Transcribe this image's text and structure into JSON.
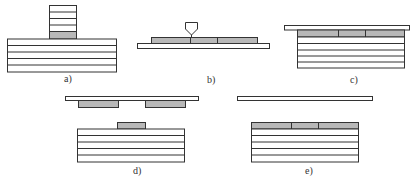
{
  "diagram": {
    "colors": {
      "stroke": "#333333",
      "tile_fill": "#b8b8b8",
      "plate_fill": "#ffffff",
      "background": "#ffffff"
    },
    "panels": [
      {
        "id": "a",
        "label": "a)"
      },
      {
        "id": "b",
        "label": "b)"
      },
      {
        "id": "c",
        "label": "c)"
      },
      {
        "id": "d",
        "label": "d)"
      },
      {
        "id": "e",
        "label": "e)"
      }
    ]
  }
}
